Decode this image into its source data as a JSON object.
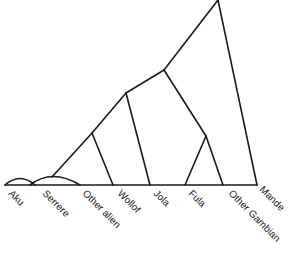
{
  "diagram": {
    "type": "tree",
    "line_color": "#1a1a1a",
    "leaves": [
      {
        "label": "Aku"
      },
      {
        "label": "Serrere"
      },
      {
        "label": "Other alien"
      },
      {
        "label": "Wollof"
      },
      {
        "label": "Jola"
      },
      {
        "label": "Fula"
      },
      {
        "label": "Other Gambian"
      },
      {
        "label": "Mande"
      }
    ]
  }
}
